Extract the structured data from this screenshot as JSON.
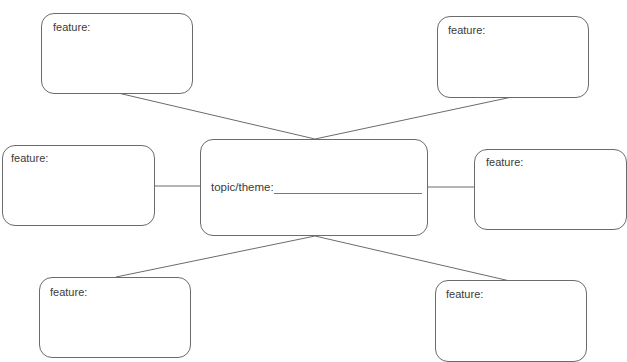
{
  "diagram": {
    "type": "spider-map",
    "central": {
      "label": "topic/theme:",
      "blank_line": true
    },
    "features": [
      {
        "position": "top-left",
        "label": "feature:"
      },
      {
        "position": "top-right",
        "label": "feature:"
      },
      {
        "position": "left",
        "label": "feature:"
      },
      {
        "position": "right",
        "label": "feature:"
      },
      {
        "position": "bottom-left",
        "label": "feature:"
      },
      {
        "position": "bottom-right",
        "label": "feature:"
      }
    ],
    "colors": {
      "border": "#6b6b6b",
      "text": "#3a3a3a",
      "background": "#ffffff"
    }
  }
}
